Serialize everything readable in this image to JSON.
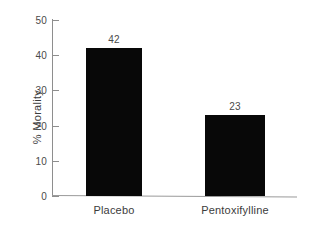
{
  "chart_data": {
    "type": "bar",
    "title": "",
    "xlabel": "",
    "ylabel": "% Morality",
    "categories": [
      "Placebo",
      "Pentoxifylline"
    ],
    "values": [
      42,
      23
    ],
    "value_labels": [
      "42",
      "23"
    ],
    "ylim": [
      0,
      50
    ],
    "yticks": [
      0,
      10,
      20,
      30,
      40,
      50
    ],
    "ytick_labels": [
      "0",
      "10",
      "20",
      "30",
      "40",
      "50"
    ],
    "grid": false,
    "legend": false,
    "colors": {
      "bar": "#080808",
      "axis": "#8e8e8e",
      "text": "#3c3c3c",
      "tick_text": "#4a4a4a",
      "background": "#ffffff"
    }
  }
}
